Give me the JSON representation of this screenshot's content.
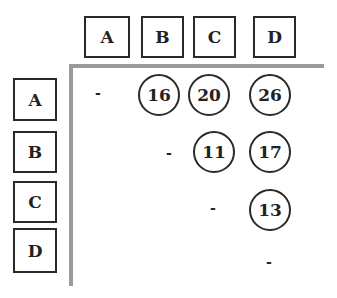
{
  "columns": [
    "A",
    "B",
    "C",
    "D"
  ],
  "rows": [
    "A",
    "B",
    "C",
    "D"
  ],
  "matrix": [
    [
      "-",
      "16",
      "20",
      "26"
    ],
    [
      "",
      "-",
      "11",
      "17"
    ],
    [
      "",
      "",
      "-",
      "13"
    ],
    [
      "",
      "",
      "",
      "-"
    ]
  ],
  "cells": {
    "AA": "-",
    "AB": "16",
    "AC": "20",
    "AD": "26",
    "BB": "-",
    "BC": "11",
    "BD": "17",
    "CC": "-",
    "CD": "13",
    "DD": "-"
  },
  "colors": {
    "border": "#2a2a2a",
    "axis_line": "#9a9a9a"
  }
}
